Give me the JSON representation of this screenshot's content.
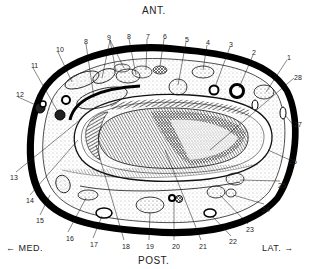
{
  "orientation": {
    "anterior": "ANT.",
    "posterior": "POST.",
    "medial": "← MED.",
    "lateral": "LAT. →"
  },
  "labels": [
    {
      "n": "1",
      "x": 287,
      "y": 54
    },
    {
      "n": "2",
      "x": 252,
      "y": 49
    },
    {
      "n": "3",
      "x": 229,
      "y": 41
    },
    {
      "n": "4",
      "x": 206,
      "y": 39
    },
    {
      "n": "5",
      "x": 185,
      "y": 36
    },
    {
      "n": "6",
      "x": 163,
      "y": 33
    },
    {
      "n": "7",
      "x": 146,
      "y": 33
    },
    {
      "n": "8",
      "x": 84,
      "y": 38
    },
    {
      "n": "9",
      "x": 107,
      "y": 34
    },
    {
      "n": "8",
      "x": 127,
      "y": 33
    },
    {
      "n": "10",
      "x": 56,
      "y": 46
    },
    {
      "n": "11",
      "x": 31,
      "y": 62
    },
    {
      "n": "12",
      "x": 16,
      "y": 91
    },
    {
      "n": "13",
      "x": 10,
      "y": 174
    },
    {
      "n": "14",
      "x": 26,
      "y": 197
    },
    {
      "n": "15",
      "x": 36,
      "y": 217
    },
    {
      "n": "16",
      "x": 66,
      "y": 235
    },
    {
      "n": "17",
      "x": 90,
      "y": 241
    },
    {
      "n": "18",
      "x": 122,
      "y": 243
    },
    {
      "n": "19",
      "x": 146,
      "y": 243
    },
    {
      "n": "20",
      "x": 172,
      "y": 243
    },
    {
      "n": "21",
      "x": 199,
      "y": 243
    },
    {
      "n": "22",
      "x": 229,
      "y": 238
    },
    {
      "n": "23",
      "x": 246,
      "y": 226
    },
    {
      "n": "24",
      "x": 262,
      "y": 206
    },
    {
      "n": "25",
      "x": 278,
      "y": 182
    },
    {
      "n": "26",
      "x": 289,
      "y": 158
    },
    {
      "n": "27",
      "x": 294,
      "y": 121
    },
    {
      "n": "28",
      "x": 294,
      "y": 74
    }
  ]
}
